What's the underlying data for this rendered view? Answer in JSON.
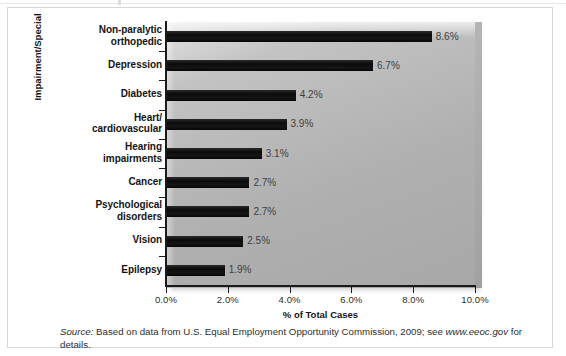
{
  "figure": {
    "source_note": {
      "label": "Source:",
      "text_before": " Based on data from U.S. Equal Employment Opportunity Commission, 2009; see ",
      "url": "www.eeoc.gov",
      "text_after": " for details."
    }
  },
  "chart_data": {
    "type": "bar",
    "orientation": "horizontal",
    "title": "",
    "xlabel": "% of Total Cases",
    "ylabel": "Impairment/Special",
    "xlim": [
      0,
      10
    ],
    "grid": false,
    "legend": "none",
    "xticklabels": [
      "0.0%",
      "2.0%",
      "4.0%",
      "6.0%",
      "8.0%",
      "10.0%"
    ],
    "xtickvalues": [
      0,
      2,
      4,
      6,
      8,
      10
    ],
    "categories": [
      "Non-paralytic orthopedic",
      "Depression",
      "Diabetes",
      "Heart/ cardiovascular",
      "Hearing impairments",
      "Cancer",
      "Psychological disorders",
      "Vision",
      "Epilepsy"
    ],
    "category_lines": [
      [
        "Non-paralytic",
        "orthopedic"
      ],
      [
        "Depression"
      ],
      [
        "Diabetes"
      ],
      [
        "Heart/",
        "cardiovascular"
      ],
      [
        "Hearing",
        "impairments"
      ],
      [
        "Cancer"
      ],
      [
        "Psychological",
        "disorders"
      ],
      [
        "Vision"
      ],
      [
        "Epilepsy"
      ]
    ],
    "values": [
      8.6,
      6.7,
      4.2,
      3.9,
      3.1,
      2.7,
      2.7,
      2.5,
      1.9
    ],
    "datalabels": [
      "8.6%",
      "6.7%",
      "4.2%",
      "3.9%",
      "3.1%",
      "2.7%",
      "2.7%",
      "2.5%",
      "1.9%"
    ],
    "bar_color": "#0d0d0d",
    "plot_bg_color": "#bdbdbd"
  }
}
